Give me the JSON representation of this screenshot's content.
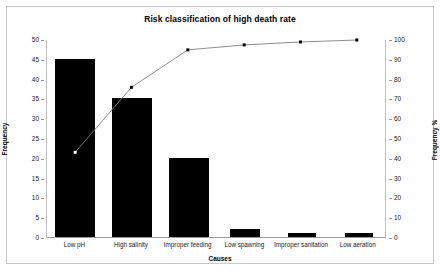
{
  "chart_data": {
    "type": "bar",
    "title": "Risk classification of high death rate",
    "xlabel": "Causes",
    "ylabel": "Frequency",
    "y2label": "Frequency %",
    "categories": [
      "Low pH",
      "High salinity",
      "Improper feeding",
      "Low spawning",
      "Improper sanitation",
      "Low aeration"
    ],
    "values": [
      45,
      35,
      20,
      2,
      1,
      1
    ],
    "cumulative_percent": [
      43,
      76,
      95,
      97.5,
      99,
      100
    ],
    "ylim": [
      0,
      50
    ],
    "y2lim": [
      0,
      100
    ],
    "yticks": [
      0,
      5,
      10,
      15,
      20,
      25,
      30,
      35,
      40,
      45,
      50
    ],
    "y2ticks": [
      0,
      10,
      20,
      30,
      40,
      50,
      60,
      70,
      80,
      90,
      100
    ],
    "grid": false,
    "legend": "none",
    "series": [
      {
        "name": "Frequency",
        "type": "bar",
        "values": [
          45,
          35,
          20,
          2,
          1,
          1
        ]
      },
      {
        "name": "Cumulative %",
        "type": "line",
        "values": [
          43,
          76,
          95,
          97.5,
          99,
          100
        ]
      }
    ],
    "colors": {
      "bar": "#000000",
      "line": "#808080",
      "marker": "#000000",
      "frame": "#c9c9c9",
      "axis": "#9a9a9a",
      "background": "#ffffff"
    }
  }
}
